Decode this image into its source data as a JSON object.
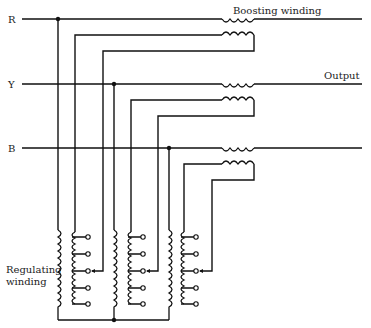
{
  "diagram": {
    "type": "circuit-schematic",
    "phase_labels": [
      "R",
      "Y",
      "B"
    ],
    "labels": {
      "boosting": "Boosting winding",
      "output": "Output",
      "regulating_line1": "Regulating",
      "regulating_line2": "winding"
    },
    "colors": {
      "line": "#111111",
      "background": "#ffffff"
    },
    "taps_per_regulating_winding": 5,
    "phases": [
      {
        "name": "R",
        "line_y": 19
      },
      {
        "name": "Y",
        "line_y": 84
      },
      {
        "name": "B",
        "line_y": 148
      }
    ]
  }
}
